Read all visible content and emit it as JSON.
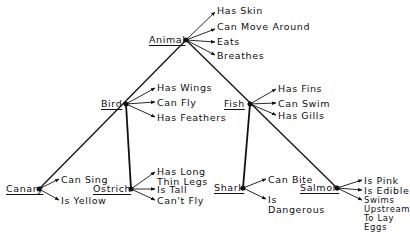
{
  "diagram": {
    "type": "semantic-network-hierarchy",
    "nodes": {
      "animal": {
        "label": "Animal",
        "properties": [
          "Has Skin",
          "Can Move Around",
          "Eats",
          "Breathes"
        ]
      },
      "bird": {
        "label": "Bird",
        "properties": [
          "Has Wings",
          "Can Fly",
          "Has Feathers"
        ]
      },
      "fish": {
        "label": "Fish",
        "properties": [
          "Has Fins",
          "Can Swim",
          "Has Gills"
        ]
      },
      "canary": {
        "label": "Canary",
        "properties": [
          "Can Sing",
          "Is Yellow"
        ]
      },
      "ostrich": {
        "label": "Ostrich",
        "properties": [
          "Has Long\nThin Legs",
          "Is Tall",
          "Can't Fly"
        ]
      },
      "shark": {
        "label": "Shark",
        "properties": [
          "Can Bite",
          "Is\nDangerous"
        ]
      },
      "salmon": {
        "label": "Salmon",
        "properties": [
          "Is Pink",
          "Is Edible",
          "Swims\nUpstream\nTo Lay\nEggs"
        ]
      }
    },
    "edges": [
      [
        "Animal",
        "Bird"
      ],
      [
        "Animal",
        "Fish"
      ],
      [
        "Bird",
        "Canary"
      ],
      [
        "Bird",
        "Ostrich"
      ],
      [
        "Fish",
        "Shark"
      ],
      [
        "Fish",
        "Salmon"
      ]
    ]
  }
}
